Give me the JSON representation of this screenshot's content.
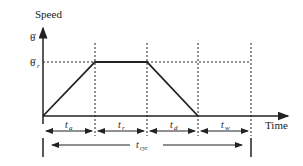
{
  "diagram": {
    "y_axis_label": "Speed",
    "x_axis_label": "Time",
    "y_levels": [
      {
        "symbol": "θ̇",
        "name": "max-speed"
      },
      {
        "symbol": "θ̇",
        "subscript": "r",
        "name": "rated-speed"
      }
    ],
    "intervals": [
      {
        "symbol": "t",
        "subscript": "a",
        "meaning": "acceleration time"
      },
      {
        "symbol": "t",
        "subscript": "r",
        "meaning": "run time"
      },
      {
        "symbol": "t",
        "subscript": "d",
        "meaning": "deceleration time"
      },
      {
        "symbol": "t",
        "subscript": "w",
        "meaning": "wait time"
      }
    ],
    "cycle": {
      "symbol": "t",
      "subscript": "cyc"
    }
  }
}
